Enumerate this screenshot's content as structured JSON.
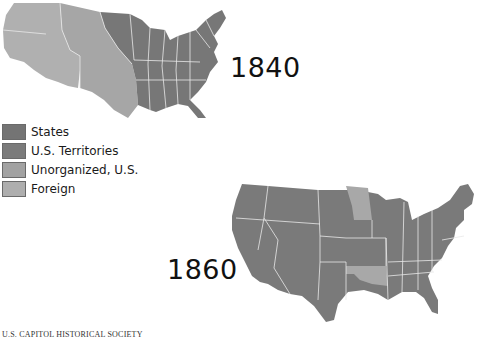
{
  "maps": [
    {
      "year_label": "1840",
      "regions": [
        "States",
        "U.S. Territories",
        "Unorganized, U.S.",
        "Foreign"
      ]
    },
    {
      "year_label": "1860",
      "regions": [
        "States",
        "U.S. Territories",
        "Unorganized, U.S."
      ]
    }
  ],
  "legend": {
    "items": [
      {
        "label": "States",
        "color": "#747474"
      },
      {
        "label": "U.S. Territories",
        "color": "#7b7b7b"
      },
      {
        "label": "Unorganized, U.S.",
        "color": "#a2a2a2"
      },
      {
        "label": "Foreign",
        "color": "#aeaeae"
      }
    ]
  },
  "colors": {
    "states": "#777777",
    "territories": "#7d7d7d",
    "unorganized": "#a6a6a6",
    "foreign": "#b0b0b0",
    "borders": "#e8e8e8"
  },
  "credit": "U.S. CAPITOL HISTORICAL SOCIETY"
}
